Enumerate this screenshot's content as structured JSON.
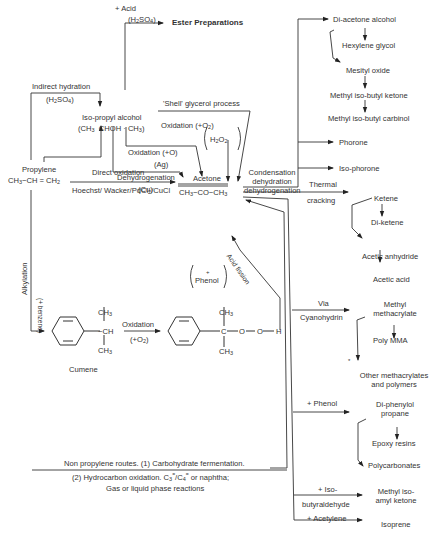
{
  "diagram": {
    "nodes": {
      "ester_preparations": "Ester Preparations",
      "iso_propyl_alcohol": "Iso-propyl alcohol",
      "iso_propyl_alcohol_formula": "(CH3 · CHOH · CH3)",
      "propylene": "Propylene",
      "propylene_formula": "CH3 − CH = CH2",
      "acetone": "Acetone",
      "acetone_formula": "CH3 − CO − CH3",
      "cumene": "Cumene",
      "di_acetone_alcohol": "Di-acetone alcohol",
      "hexylene_glycol": "Hexylene glycol",
      "mesityl_oxide": "Mesityl oxide",
      "methyl_iso_butyl_ketone": "Methyl iso-butyl ketone",
      "methyl_iso_butyl_carbinol": "Methyl iso-butyl carbinol",
      "phorone": "Phorone",
      "iso_phorone": "Iso-phorone",
      "ketene": "Ketene",
      "di_ketene": "Di-ketene",
      "acetic_anhydride": "Acetic anhydride",
      "acetic_acid": "Acetic acid",
      "methyl_methacrylate_1": "Methyl",
      "methyl_methacrylate_2": "methacrylate",
      "poly_mma": "Poly MMA",
      "other_methacrylates_1": "Other methacrylates",
      "other_methacrylates_2": "and polymers",
      "di_phenylol_1": "Di-phenylol",
      "di_phenylol_2": "propane",
      "epoxy_resins": "Epoxy resins",
      "polycarbonates": "Polycarbonates",
      "methyl_iso_amyl_1": "Methyl iso-",
      "methyl_iso_amyl_2": "amyl ketone",
      "isoprene": "Isoprene"
    },
    "edges": {
      "acid": "+ Acid",
      "acid_catalyst": "(H2SO4)",
      "indirect_hydration": "Indirect hydration",
      "indirect_hydration_catalyst": "(H2SO4)",
      "direct_hydration": "Direct hydration",
      "direct_hydration_catalyst": "(H3PO4)",
      "shell_glycerol": "'Shell' glycerol process",
      "oxidation_o2": "Oxidation (+O2)",
      "h2o2": "H2O2",
      "oxidation_o": "Oxidation (+O)",
      "oxidation_o_catalyst": "(Ag)",
      "dehydrogenation": "Dehydrogenation",
      "dehydrogenation_catalyst": "(Cu)",
      "direct_oxidation": "Direct oxidation",
      "hoechst_wacker": "Hoechst/Wacker/PdCl2/CuCl",
      "condensation_1": "Condensation",
      "condensation_2": "dehydration",
      "condensation_3": "dehydrogenation",
      "thermal_1": "Thermal",
      "thermal_2": "cracking",
      "alkylation": "Alkylation",
      "benzene": "(+ benzene)",
      "phenol_byproduct": "Phenol",
      "phenol_plus": "+",
      "acid_fission": "Acid fission",
      "cumene_oxidation": "Oxidation",
      "cumene_oxidation_reagent": "(+O2)",
      "via": "Via",
      "cyanohydrin": "Cyanohydrin",
      "plus_phenol": "+ Phenol",
      "plus_iso": "+ Iso-",
      "butyraldehyde": "butyraldehyde",
      "plus_acetylene": "+ Acetylene"
    },
    "structures": {
      "ch3": "CH3",
      "ch": "CH",
      "c": "C",
      "o": "O",
      "h": "H"
    },
    "footnote": {
      "line1": "Non propylene routes. (1) Carbohydrate fermentation.",
      "line2a": "(2) Hydrocarbon oxidation. C3",
      "line2b": "/C4",
      "line2c": " or naphtha;",
      "line3": "Gas or liquid phase reactions"
    }
  }
}
